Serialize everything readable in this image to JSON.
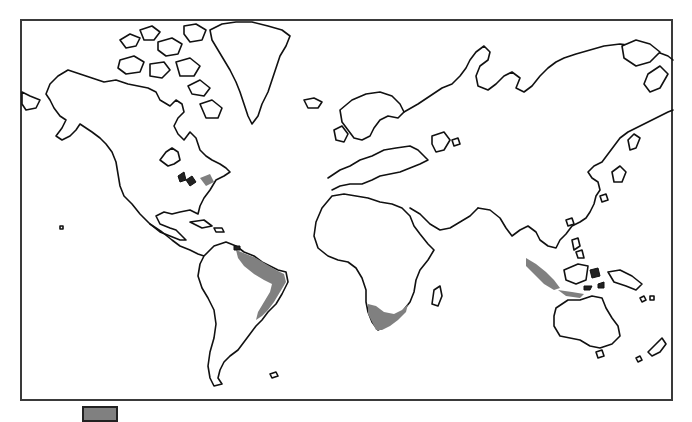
{
  "map": {
    "type": "world outline map (Mercator-like)",
    "frame": {
      "x": 20,
      "y": 19,
      "width": 653,
      "height": 382,
      "border_color": "#3a3a3a"
    },
    "colors": {
      "land": "#ffffff",
      "coastline": "#111111",
      "highlight": "#808080"
    },
    "highlighted_regions": [
      {
        "name": "Northeastern Brazil coastal belt",
        "fill": "#808080"
      },
      {
        "name": "Southern Africa (Cape region)",
        "fill": "#808080"
      },
      {
        "name": "Sumatra / Java (Indonesia)",
        "fill": "#808080"
      },
      {
        "name": "Great Lakes / St. Lawrence area",
        "fill": "#808080"
      }
    ]
  },
  "legend": {
    "swatch_color": "#808080",
    "label": ""
  }
}
